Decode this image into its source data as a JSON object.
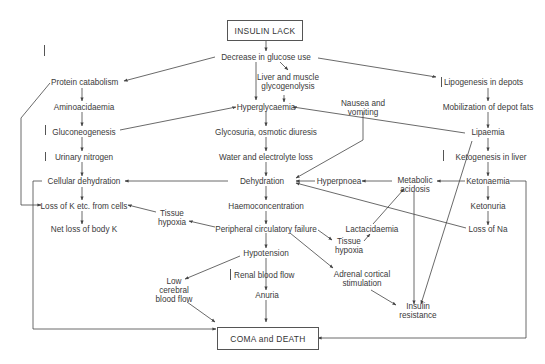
{
  "diagram": {
    "title_box": "INSULIN  LACK",
    "end_box": "COMA and DEATH",
    "nodes": {
      "decrease_glucose": "Decrease in glucose use",
      "protein_catabolism": "Protein catabolism",
      "aminoacidaemia": "Aminoacidaemia",
      "gluconeogenesis": "Gluconeogenesis",
      "urinary_nitrogen": "Urinary nitrogen",
      "cellular_dehydration": "Cellular dehydration",
      "loss_k": "Loss of K etc. from cells",
      "net_loss_k": "Net loss of body K",
      "liver_glyco_1": "Liver and muscle",
      "liver_glyco_2": "glycogenolysis",
      "hyperglycaemia": "Hyperglycaemia",
      "glycosuria": "Glycosuria, osmotic diuresis",
      "water_loss": "Water and electrolyte loss",
      "dehydration": "Dehydration",
      "haemoconcentration": "Haemoconcentration",
      "peripheral_failure": "Peripheral circulatory failure",
      "hypotension": "Hypotension",
      "renal_flow": "Renal blood flow",
      "anuria": "Anuria",
      "low_cerebral_1": "Low",
      "low_cerebral_2": "cerebral",
      "low_cerebral_3": "blood flow",
      "tissue_hypoxia_left_1": "Tissue",
      "tissue_hypoxia_left_2": "hypoxia",
      "tissue_hypoxia_right_1": "Tissue",
      "tissue_hypoxia_right_2": "hypoxia",
      "nausea_1": "Nausea and",
      "nausea_2": "vomiting",
      "lipogenesis": "Lipogenesis in depots",
      "mobilization": "Mobilization of depot fats",
      "lipaemia": "Lipaemia",
      "ketogenesis": "Ketogenesis  in liver",
      "ketonaemia": "Ketonaemia",
      "ketonuria": "Ketonuria",
      "loss_na": "Loss of Na",
      "metabolic_acidosis_1": "Metabolic",
      "metabolic_acidosis_2": "acidosis",
      "hyperpnoea": "Hyperpnoea",
      "lactacidaemia": "Lactacidaemia",
      "adrenal_1": "Adrenal cortical",
      "adrenal_2": "stimulation",
      "insulin_resistance_1": "Insulin",
      "insulin_resistance_2": "resistance"
    },
    "indicators": {
      "protein_catabolism": "increase",
      "gluconeogenesis": "increase",
      "urinary_nitrogen": "increase",
      "lipogenesis": "decrease",
      "ketogenesis": "increase",
      "renal_flow": "decrease"
    },
    "colors": {
      "line": "#444444",
      "text": "#3a3a3a",
      "background": "#ffffff"
    }
  }
}
